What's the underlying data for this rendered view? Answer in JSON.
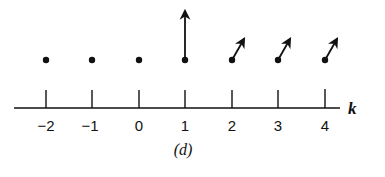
{
  "figure": {
    "caption": "(d)",
    "axis_variable": "k",
    "ink_color": "#111111",
    "background_color": "#ffffff"
  },
  "axis": {
    "ticks": [
      {
        "value": -2,
        "label": "−2"
      },
      {
        "value": -1,
        "label": "−1"
      },
      {
        "value": 0,
        "label": "0"
      },
      {
        "value": 1,
        "label": "1"
      },
      {
        "value": 2,
        "label": "2"
      },
      {
        "value": 3,
        "label": "3"
      },
      {
        "value": 4,
        "label": "4"
      }
    ]
  },
  "points": [
    {
      "k": -2,
      "marker": "dot"
    },
    {
      "k": -1,
      "marker": "dot"
    },
    {
      "k": 0,
      "marker": "dot"
    },
    {
      "k": 1,
      "marker": "dot-with-vertical-arrow"
    },
    {
      "k": 2,
      "marker": "dot-with-diagonal-arrow"
    },
    {
      "k": 3,
      "marker": "dot-with-diagonal-arrow"
    },
    {
      "k": 4,
      "marker": "dot-with-diagonal-arrow"
    }
  ]
}
